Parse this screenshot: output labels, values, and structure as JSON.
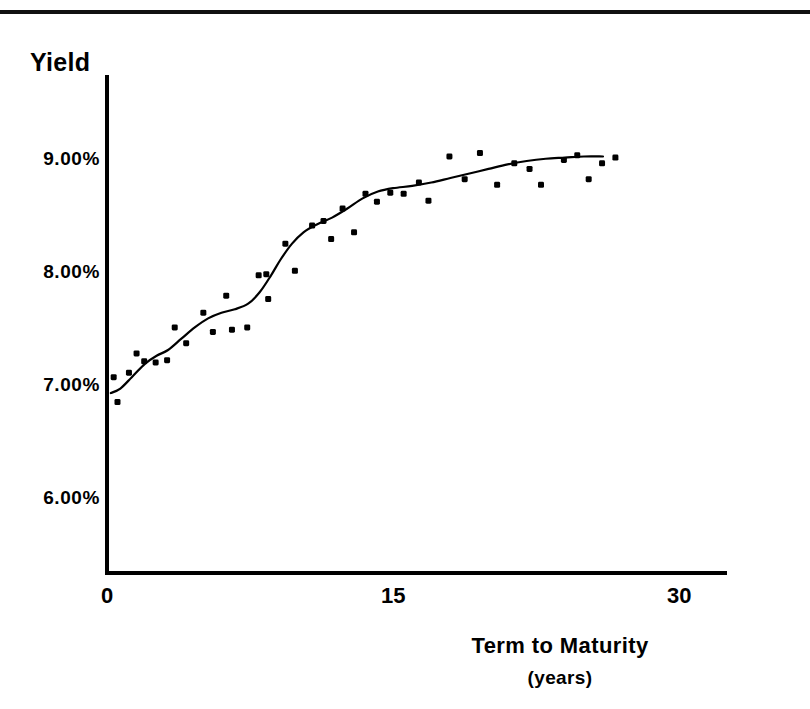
{
  "figure": {
    "background_color": "#ffffff",
    "ink_color": "#000000",
    "top_rule": true
  },
  "chart_data": {
    "type": "scatter",
    "title": "",
    "xlabel": "Term to Maturity",
    "xlabel_sub": "(years)",
    "ylabel": "Yield",
    "xlim": [
      0,
      32.5
    ],
    "ylim": [
      5.35,
      9.75
    ],
    "grid": false,
    "legend": null,
    "xticks": [
      0,
      15,
      30
    ],
    "xticklabels": [
      "0",
      "15",
      "30"
    ],
    "yticks": [
      6.0,
      7.0,
      8.0,
      9.0
    ],
    "yticklabels": [
      "6.00%",
      "7.00%",
      "8.00%",
      "9.00%"
    ],
    "series": [
      {
        "name": "observed yields",
        "type": "scatter",
        "marker": "square-dot",
        "points": [
          [
            0.35,
            7.08
          ],
          [
            0.55,
            6.86
          ],
          [
            1.15,
            7.12
          ],
          [
            1.55,
            7.29
          ],
          [
            1.95,
            7.22
          ],
          [
            2.55,
            7.21
          ],
          [
            3.15,
            7.23
          ],
          [
            3.55,
            7.52
          ],
          [
            4.15,
            7.38
          ],
          [
            5.05,
            7.65
          ],
          [
            5.55,
            7.48
          ],
          [
            6.25,
            7.8
          ],
          [
            6.55,
            7.5
          ],
          [
            7.35,
            7.52
          ],
          [
            7.95,
            7.98
          ],
          [
            8.35,
            7.99
          ],
          [
            8.45,
            7.77
          ],
          [
            9.35,
            8.26
          ],
          [
            9.85,
            8.02
          ],
          [
            10.75,
            8.42
          ],
          [
            11.35,
            8.46
          ],
          [
            11.75,
            8.3
          ],
          [
            12.35,
            8.57
          ],
          [
            12.95,
            8.36
          ],
          [
            13.55,
            8.7
          ],
          [
            14.15,
            8.63
          ],
          [
            14.85,
            8.71
          ],
          [
            15.55,
            8.7
          ],
          [
            16.35,
            8.8
          ],
          [
            16.85,
            8.64
          ],
          [
            17.95,
            9.03
          ],
          [
            18.75,
            8.83
          ],
          [
            19.55,
            9.06
          ],
          [
            20.45,
            8.78
          ],
          [
            21.35,
            8.97
          ],
          [
            22.15,
            8.92
          ],
          [
            22.75,
            8.78
          ],
          [
            23.95,
            9.0
          ],
          [
            24.65,
            9.04
          ],
          [
            25.25,
            8.83
          ],
          [
            25.95,
            8.97
          ],
          [
            26.65,
            9.02
          ]
        ]
      },
      {
        "name": "fitted yield curve",
        "type": "line",
        "points": [
          [
            0.2,
            6.94
          ],
          [
            0.7,
            6.98
          ],
          [
            1.3,
            7.08
          ],
          [
            2.0,
            7.2
          ],
          [
            2.6,
            7.27
          ],
          [
            3.2,
            7.32
          ],
          [
            3.9,
            7.42
          ],
          [
            4.6,
            7.52
          ],
          [
            5.3,
            7.6
          ],
          [
            6.0,
            7.65
          ],
          [
            6.7,
            7.68
          ],
          [
            7.4,
            7.73
          ],
          [
            8.0,
            7.83
          ],
          [
            8.6,
            7.98
          ],
          [
            9.1,
            8.12
          ],
          [
            9.7,
            8.26
          ],
          [
            10.3,
            8.36
          ],
          [
            11.0,
            8.43
          ],
          [
            11.8,
            8.49
          ],
          [
            12.6,
            8.57
          ],
          [
            13.4,
            8.66
          ],
          [
            14.2,
            8.72
          ],
          [
            15.0,
            8.75
          ],
          [
            16.0,
            8.77
          ],
          [
            17.0,
            8.8
          ],
          [
            18.0,
            8.84
          ],
          [
            19.0,
            8.88
          ],
          [
            20.0,
            8.92
          ],
          [
            21.0,
            8.96
          ],
          [
            22.0,
            8.99
          ],
          [
            23.0,
            9.01
          ],
          [
            24.0,
            9.02
          ],
          [
            25.0,
            9.03
          ],
          [
            26.0,
            9.03
          ]
        ]
      }
    ]
  }
}
